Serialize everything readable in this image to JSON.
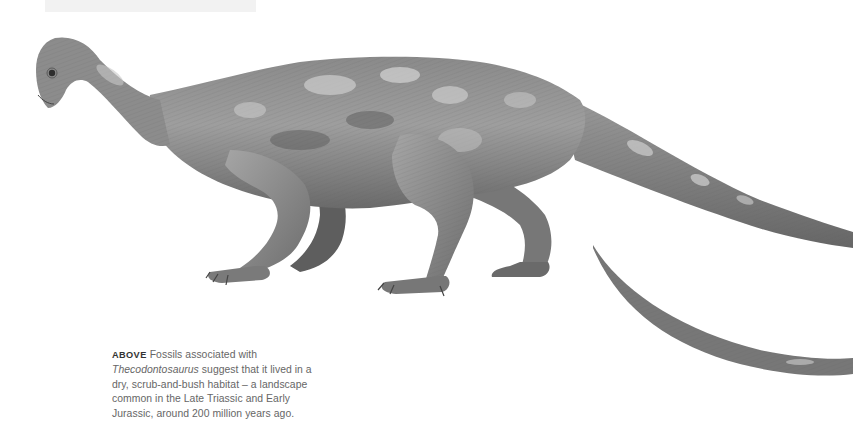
{
  "page": {
    "background": "#ffffff",
    "top_box_color": "#f2f2f2"
  },
  "illustration": {
    "subject": "Thecodontosaurus",
    "style": "graphite pencil drawing",
    "parts": [
      "head",
      "neck",
      "body",
      "forelimbs",
      "hindlimbs",
      "tail",
      "tail-tip-inset"
    ],
    "palette": {
      "dark": "#4a4a4a",
      "mid": "#7d7d7d",
      "light": "#b8b8b8",
      "highlight": "#d9d9d9"
    }
  },
  "caption": {
    "lead": "ABOVE",
    "text_before": "Fossils associated with ",
    "species": "Thecodontosaurus",
    "text_after": " suggest that it lived in a dry, scrub-and-bush habitat – a landscape common in the Late Triassic and Early Jurassic, around 200 million years ago."
  }
}
